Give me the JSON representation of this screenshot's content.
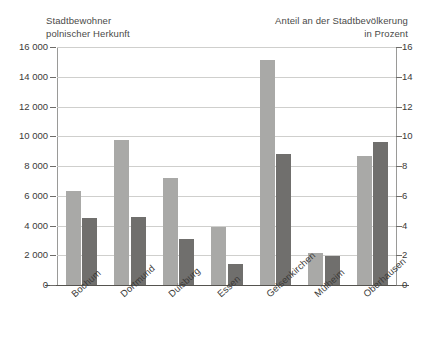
{
  "chart_data": {
    "type": "bar",
    "title": "",
    "categories": [
      "Bochum",
      "Dortmund",
      "Duisburg",
      "Essen",
      "Gelsenkirchen",
      "Mülheim",
      "Oberhausen"
    ],
    "series": [
      {
        "name": "Stadtbewohner polnischer Herkunft",
        "axis": "left",
        "color": "#a9a9a7",
        "values": [
          6300,
          9750,
          7200,
          3900,
          15100,
          2150,
          8700
        ]
      },
      {
        "name": "Anteil an der Stadtbevölkerung in Prozent",
        "axis": "right",
        "color": "#706f6d",
        "values": [
          4.5,
          4.55,
          3.1,
          1.4,
          8.8,
          1.95,
          9.6
        ]
      }
    ],
    "left_axis": {
      "label": "Stadtbewohner\npolnischer Herkunft",
      "ticks": [
        "0",
        "2 000",
        "4 000",
        "6 000",
        "8 000",
        "10 000",
        "12 000",
        "14 000",
        "16 000"
      ],
      "min": 0,
      "max": 16000,
      "step": 2000
    },
    "right_axis": {
      "label": "Anteil an der Stadtbevölkerung\nin Prozent",
      "ticks": [
        "0",
        "2",
        "4",
        "6",
        "8",
        "10",
        "12",
        "14",
        "16"
      ],
      "min": 0,
      "max": 16,
      "step": 2
    },
    "xlabel": "",
    "grid": true,
    "legend": "none"
  }
}
